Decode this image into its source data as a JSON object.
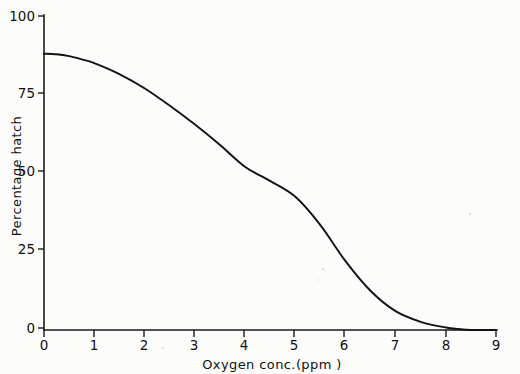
{
  "figure": {
    "background_color": "#fcfcfa",
    "line_color": "#111111",
    "axis_color": "#1a1a1a"
  },
  "chart_data": {
    "type": "line",
    "title": "",
    "xlabel": "Oxygen  conc.(ppm )",
    "ylabel": "Percentage hatch",
    "xlim": [
      0,
      9
    ],
    "ylim": [
      0,
      100
    ],
    "grid": false,
    "legend": null,
    "xticks": [
      0,
      1,
      2,
      3,
      4,
      5,
      6,
      7,
      8,
      9
    ],
    "xticklabels": [
      "0",
      "1",
      "2",
      "3",
      "4",
      "5",
      "6",
      "7",
      "8",
      "9"
    ],
    "yticks": [
      0,
      25,
      50,
      75,
      100
    ],
    "yticklabels": [
      "0",
      "25",
      "50",
      "75",
      "100"
    ],
    "series": [
      {
        "name": "Percentage hatch",
        "x": [
          0.0,
          0.25,
          0.5,
          0.75,
          1.0,
          1.5,
          2.0,
          2.5,
          3.0,
          3.5,
          4.0,
          4.5,
          5.0,
          5.5,
          6.0,
          6.5,
          7.0,
          7.5,
          8.0,
          8.25,
          8.5,
          9.0
        ],
        "values": [
          88.0,
          87.8,
          87.2,
          86.2,
          85.0,
          81.5,
          77.0,
          71.5,
          65.5,
          59.0,
          52.0,
          47.5,
          42.5,
          33.5,
          22.0,
          12.5,
          6.0,
          2.6,
          0.8,
          0.3,
          0.0,
          0.0
        ]
      }
    ]
  },
  "axes": {
    "y_title": "Percentage hatch",
    "x_title": "Oxygen  conc.(ppm )",
    "y_labels": [
      "100",
      "75",
      "50",
      "25",
      "0"
    ],
    "x_labels": [
      "0",
      "1",
      "2",
      "3",
      "4",
      "5",
      "6",
      "7",
      "8",
      "9"
    ]
  }
}
